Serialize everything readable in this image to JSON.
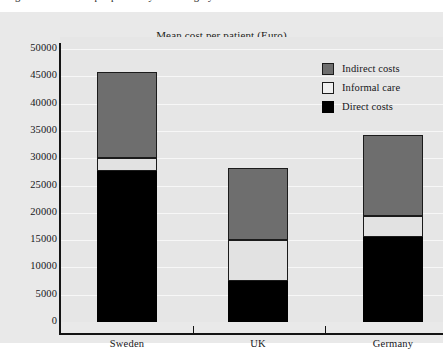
{
  "caption": {
    "text": "Figure 3.  Mean cost per patient by cost category"
  },
  "chart_data": {
    "type": "bar",
    "title": "Mean cost per patient (Euro)",
    "xlabel": "",
    "ylabel": "",
    "stacked": true,
    "grid": true,
    "legend_position": "top-right",
    "categories": [
      "Sweden",
      "UK",
      "Germany"
    ],
    "ylim": [
      0,
      50000
    ],
    "ytick_labels": [
      "50000",
      "45000",
      "40000",
      "35000",
      "30000",
      "25000",
      "20000",
      "15000",
      "10000",
      "5000",
      "0"
    ],
    "ytick_values": [
      50000,
      45000,
      40000,
      35000,
      30000,
      25000,
      20000,
      15000,
      10000,
      5000,
      0
    ],
    "series": [
      {
        "name": "Direct costs",
        "color": "#000000",
        "values": [
          27700,
          7500,
          15600
        ]
      },
      {
        "name": "Informal care",
        "color": "#e2e2e2",
        "values": [
          2300,
          7500,
          3800
        ]
      },
      {
        "name": "Indirect costs",
        "color": "#6e6e6e",
        "values": [
          15700,
          13200,
          14800
        ]
      }
    ],
    "totals": [
      45700,
      28200,
      34200
    ]
  },
  "legend": {
    "items": [
      {
        "label": "Indirect costs",
        "swatch": "indirect-costs-swatch"
      },
      {
        "label": "Informal care",
        "swatch": "informal-care-swatch"
      },
      {
        "label": "Direct costs",
        "swatch": "direct-costs-swatch"
      }
    ]
  },
  "colors": {
    "panel_background": "#e9e9e9",
    "plot_background": "#e6e6e6",
    "gridline": "#f7f7f7",
    "axis": "#141414",
    "text": "#16161a",
    "indirect": "#6e6e6e",
    "informal": "#e2e2e2",
    "direct": "#000000"
  }
}
